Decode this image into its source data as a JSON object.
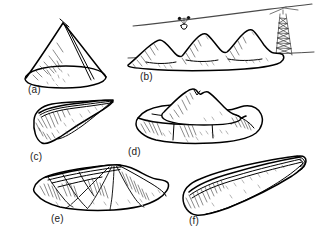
{
  "figure": {
    "background_color": "#ffffff",
    "ink_color": "#000000",
    "width": 319,
    "height": 238,
    "style": "hand-drawn pen-and-ink line diagram with hatched shading"
  },
  "panels": [
    {
      "key": "a",
      "label": "(a)",
      "name": "conical-heap",
      "description": "Conical spoil heap with single apex, aerial ropeway line running down the right flank, hatched shading on left face",
      "label_x": 28,
      "label_y": 84
    },
    {
      "key": "b",
      "label": "(b)",
      "name": "multiple-conical-heaps-with-aerial-ropeway",
      "description": "Row of four coalescing conical heaps beneath an aerial ropeway with a suspended trolley bucket and a lattice support tower at right",
      "label_x": 140,
      "label_y": 71,
      "mound_count": 4,
      "features": [
        "ropeway-cable",
        "trolley-bucket",
        "lattice-tower",
        "ground-line"
      ]
    },
    {
      "key": "c",
      "label": "(c)",
      "name": "ridge-heap",
      "description": "Elongated narrow ridge heap with straight crest line and steep hatched side slope",
      "label_x": 30,
      "label_y": 151
    },
    {
      "key": "d",
      "label": "(d)",
      "name": "terraced-plateau-heap",
      "description": "Terraced heap with flat benched plateau and a secondary conical mound rising from the upper terrace",
      "label_x": 128,
      "label_y": 146
    },
    {
      "key": "e",
      "label": "(e)",
      "name": "fan-lobed-heap",
      "description": "Multi-lobed fan-shaped heap of overlapping finger tips radiating from a common head",
      "label_x": 51,
      "label_y": 213
    },
    {
      "key": "f",
      "label": "(f)",
      "name": "elongated-finger-heap",
      "description": "Single long finger or tongue-shaped heap with rounded snout and flat narrow crest",
      "label_x": 189,
      "label_y": 215
    }
  ]
}
